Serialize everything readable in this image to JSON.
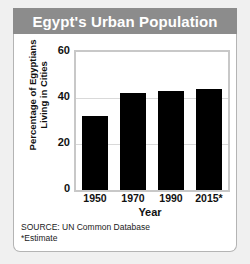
{
  "title": "Egypt's Urban Population",
  "footnotes": {
    "source": "SOURCE: UN Common Database",
    "estimate": "*Estimate"
  },
  "colors": {
    "banner": "#8c8c8c",
    "banner_text": "#ffffff",
    "bar": "#000000",
    "card": "#ffffff",
    "page_background": "#f0f0f0",
    "gridline": "#d9d9d9",
    "plot_border": "#c8c8c8"
  },
  "chart_data": {
    "type": "bar",
    "title": "Egypt's Urban Population",
    "categories": [
      "1950",
      "1970",
      "1990",
      "2015*"
    ],
    "values": [
      32,
      42,
      43,
      44
    ],
    "xlabel": "Year",
    "ylabel": "Percentage of Egyptians Living in Cities",
    "ylim": [
      0,
      60
    ],
    "yticks": [
      0,
      20,
      40,
      60
    ],
    "ytick_labels": [
      "0",
      "20",
      "40",
      "60"
    ],
    "grid": true,
    "legend": false,
    "series": [
      {
        "name": "Percentage of Egyptians Living in Cities",
        "values": [
          32,
          42,
          43,
          44
        ]
      }
    ]
  }
}
